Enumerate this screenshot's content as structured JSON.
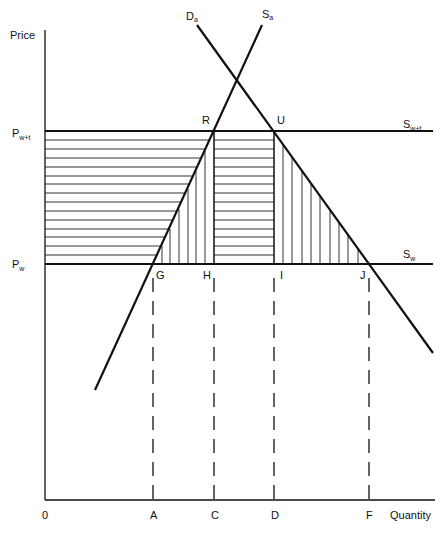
{
  "diagram": {
    "type": "tariff-welfare-diagram",
    "axes": {
      "y_label": "Price",
      "x_label": "Quantity",
      "origin_label": "0",
      "x_ticks": [
        {
          "label": "A",
          "x": 153
        },
        {
          "label": "C",
          "x": 214
        },
        {
          "label": "D",
          "x": 274
        },
        {
          "label": "F",
          "x": 369
        }
      ]
    },
    "price_levels": [
      {
        "id": "pwt",
        "label_main": "P",
        "label_sub": "w+t",
        "y": 131
      },
      {
        "id": "pw",
        "label_main": "P",
        "label_sub": "w",
        "y": 264
      }
    ],
    "curves": [
      {
        "id": "demand",
        "label_main": "D",
        "label_sub": "a"
      },
      {
        "id": "supply",
        "label_main": "S",
        "label_sub": "a"
      },
      {
        "id": "world_supply_tariff",
        "label_main": "S",
        "label_sub": "w+t"
      },
      {
        "id": "world_supply",
        "label_main": "S",
        "label_sub": "w"
      }
    ],
    "points": [
      {
        "label": "R"
      },
      {
        "label": "U"
      },
      {
        "label": "G"
      },
      {
        "label": "H"
      },
      {
        "label": "I"
      },
      {
        "label": "J"
      }
    ],
    "colors": {
      "line": "#111111",
      "hatch": "#333333",
      "background": "#ffffff"
    }
  }
}
